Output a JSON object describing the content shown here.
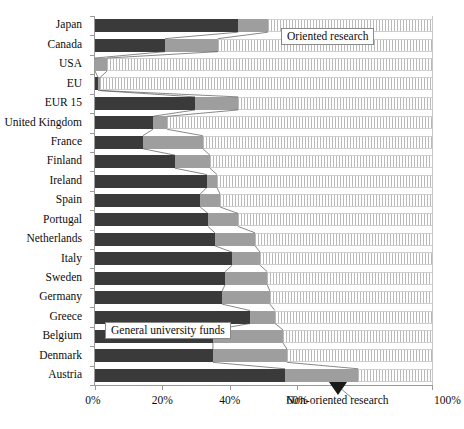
{
  "chart_data": {
    "type": "bar",
    "orientation": "horizontal",
    "stacked": true,
    "normalized": true,
    "title": "",
    "subtitle": "",
    "xlabel": "",
    "ylabel": "",
    "xlim": [
      0,
      100
    ],
    "grid": false,
    "legend_position": "inline-callouts",
    "x_ticks": [
      {
        "value": 0,
        "label": "0%"
      },
      {
        "value": 20,
        "label": "20%"
      },
      {
        "value": 40,
        "label": "40%"
      },
      {
        "value": 60,
        "label": "60%"
      },
      {
        "value": 100,
        "label": "100%"
      }
    ],
    "categories": [
      "Japan",
      "Canada",
      "USA",
      "EU",
      "EUR 15",
      "United Kingdom",
      "France",
      "Finland",
      "Ireland",
      "Spain",
      "Portugal",
      "Netherlands",
      "Italy",
      "Sweden",
      "Germany",
      "Greece",
      "Belgium",
      "Denmark",
      "Austria"
    ],
    "series": [
      {
        "name": "General university funds",
        "color": "#3a3a3a",
        "values": [
          42.4,
          20.8,
          0.0,
          0.9,
          29.7,
          17.2,
          14.2,
          23.7,
          33.2,
          31.2,
          33.5,
          35.6,
          40.7,
          38.6,
          37.7,
          46.0,
          35.0,
          35.0,
          56.4
        ]
      },
      {
        "name": "Oriented research",
        "color": "#9e9e9e",
        "values": [
          8.9,
          15.7,
          3.6,
          0.6,
          12.8,
          4.2,
          17.8,
          10.4,
          3.0,
          5.9,
          8.9,
          11.9,
          8.3,
          12.5,
          14.2,
          7.4,
          20.8,
          22.0,
          21.7
        ]
      },
      {
        "name": "Non-oriented research",
        "color": "#ffffff",
        "pattern": "vertical-hatch",
        "values": [
          48.7,
          63.5,
          96.4,
          98.5,
          57.5,
          78.6,
          68.0,
          65.9,
          63.8,
          62.9,
          57.6,
          52.5,
          51.0,
          48.9,
          48.1,
          46.6,
          44.2,
          43.0,
          21.9
        ]
      }
    ],
    "annotations": [
      {
        "name": "oriented-research-callout",
        "text": "Oriented research",
        "style": "boxed"
      },
      {
        "name": "general-university-funds-callout",
        "text": "General university funds",
        "style": "boxed"
      },
      {
        "name": "non-oriented-research-callout",
        "text": "Non-oriented research",
        "style": "plain-with-arrow"
      }
    ]
  }
}
